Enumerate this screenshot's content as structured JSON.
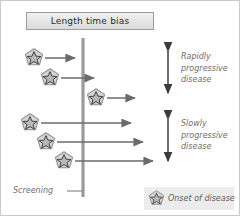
{
  "figure": {
    "title": "Length time bias",
    "width": 240,
    "height": 216,
    "background_color": "#ffffff",
    "border_color": "#c9c9c9"
  },
  "colors": {
    "title_border": "#9b9b9b",
    "title_fill": "#e4e4e4",
    "title_text": "#2b2b2b",
    "label_text": "#6d6d6d",
    "arrow": "#6b6b6b",
    "screening_line": "#9a9a9a",
    "star_fill": "#c3c3c3",
    "star_outline": "#4a4a4a",
    "badge_fill": "#d9d9d9",
    "badge_outline": "#8a8a8a",
    "legend_fill": "#ececec"
  },
  "screening_line": {
    "label": "Screening",
    "x": 82,
    "y_top": 37,
    "y_bottom": 196,
    "leader_line": {
      "x1": 68,
      "y1": 190,
      "x2": 82,
      "y2": 190
    }
  },
  "groups": [
    {
      "name": "rapidly-progressive",
      "label_lines": [
        "Rapidly",
        "progressive",
        "disease"
      ],
      "bracket": {
        "x": 167,
        "y_top": 50,
        "y_bottom": 92
      },
      "cases": [
        {
          "index": 1,
          "onset_x": 33,
          "y": 57,
          "arrow_start_x": 44,
          "arrow_end_x": 74,
          "crosses_screening": false
        },
        {
          "index": 2,
          "onset_x": 49,
          "y": 77,
          "arrow_start_x": 60,
          "arrow_end_x": 93,
          "crosses_screening": true
        },
        {
          "index": 3,
          "onset_x": 95,
          "y": 97,
          "arrow_start_x": 106,
          "arrow_end_x": 134,
          "crosses_screening": false
        }
      ]
    },
    {
      "name": "slowly-progressive",
      "label_lines": [
        "Slowly",
        "progressive",
        "disease"
      ],
      "bracket": {
        "x": 167,
        "y_top": 118,
        "y_bottom": 160
      },
      "cases": [
        {
          "index": 4,
          "onset_x": 29,
          "y": 122,
          "arrow_start_x": 40,
          "arrow_end_x": 130,
          "crosses_screening": true
        },
        {
          "index": 5,
          "onset_x": 45,
          "y": 141,
          "arrow_start_x": 56,
          "arrow_end_x": 142,
          "crosses_screening": true
        },
        {
          "index": 6,
          "onset_x": 63,
          "y": 160,
          "arrow_start_x": 74,
          "arrow_end_x": 152,
          "crosses_screening": true
        }
      ]
    }
  ],
  "legend": {
    "text": "Onset of disease",
    "icon": "star-badge-icon"
  }
}
